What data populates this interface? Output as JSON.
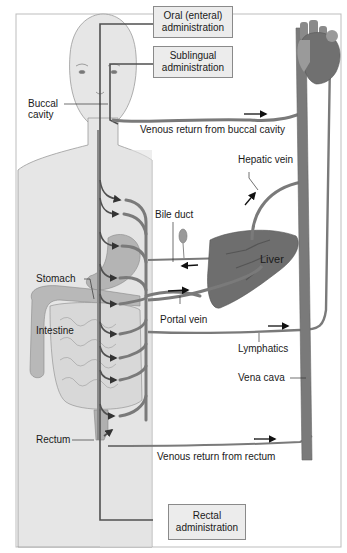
{
  "boxes": {
    "oral": [
      "Oral (enteral)",
      "administration"
    ],
    "sublingual": [
      "Sublingual",
      "administration"
    ],
    "rectal": [
      "Rectal",
      "administration"
    ]
  },
  "labels": {
    "buccal": [
      "Buccal",
      "cavity"
    ],
    "venous_buccal": "Venous return from buccal cavity",
    "hepatic_vein": "Hepatic vein",
    "bile_duct": "Bile duct",
    "liver": "Liver",
    "stomach": "Stomach",
    "intestine": "Intestine",
    "portal_vein": "Portal vein",
    "lymphatics": "Lymphatics",
    "vena_cava": "Vena cava",
    "rectum": "Rectum",
    "venous_rectum": "Venous return from rectum"
  },
  "colors": {
    "body_fill": "#e6e6e6",
    "body_stroke": "#9a9a9a",
    "vessel": "#7a7a7a",
    "route_line": "#505050",
    "liver": "#6e6e6e",
    "heart": "#707070",
    "heart_light": "#9a9a9a",
    "organ": "#b4b4b4",
    "box_fill": "#ececec"
  }
}
